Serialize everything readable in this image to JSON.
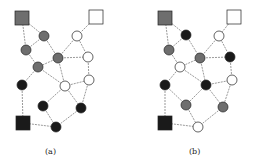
{
  "figure": {
    "panels": [
      {
        "label": "(a)",
        "colors": {
          "gray": "#6e6e6e",
          "black": "#1a1a1a",
          "white": "#ffffff",
          "edge": "#555555"
        },
        "nodes": [
          {
            "id": "sq_gray",
            "shape": "square",
            "fill": "gray",
            "x": 22,
            "y": 18
          },
          {
            "id": "sq_white",
            "shape": "square",
            "fill": "white",
            "x": 96,
            "y": 17
          },
          {
            "id": "sq_black",
            "shape": "square",
            "fill": "black",
            "x": 23,
            "y": 123
          },
          {
            "id": "g1",
            "shape": "circle",
            "fill": "gray",
            "x": 44,
            "y": 36
          },
          {
            "id": "g2",
            "shape": "circle",
            "fill": "gray",
            "x": 26,
            "y": 50
          },
          {
            "id": "g3",
            "shape": "circle",
            "fill": "gray",
            "x": 58,
            "y": 58
          },
          {
            "id": "g4",
            "shape": "circle",
            "fill": "gray",
            "x": 38,
            "y": 67
          },
          {
            "id": "w1",
            "shape": "circle",
            "fill": "white",
            "x": 77,
            "y": 36
          },
          {
            "id": "w2",
            "shape": "circle",
            "fill": "white",
            "x": 88,
            "y": 57
          },
          {
            "id": "w3",
            "shape": "circle",
            "fill": "white",
            "x": 65,
            "y": 86
          },
          {
            "id": "w4",
            "shape": "circle",
            "fill": "white",
            "x": 89,
            "y": 80
          },
          {
            "id": "b1",
            "shape": "circle",
            "fill": "black",
            "x": 22,
            "y": 85
          },
          {
            "id": "b2",
            "shape": "circle",
            "fill": "black",
            "x": 43,
            "y": 106
          },
          {
            "id": "b3",
            "shape": "circle",
            "fill": "black",
            "x": 81,
            "y": 108
          },
          {
            "id": "b4",
            "shape": "circle",
            "fill": "black",
            "x": 56,
            "y": 127
          }
        ],
        "edges": [
          [
            "sq_gray",
            "g1"
          ],
          [
            "sq_gray",
            "g2"
          ],
          [
            "g1",
            "g2"
          ],
          [
            "g1",
            "g3"
          ],
          [
            "g2",
            "g4"
          ],
          [
            "g3",
            "g4"
          ],
          [
            "g3",
            "w1"
          ],
          [
            "g3",
            "w2"
          ],
          [
            "g3",
            "w3"
          ],
          [
            "g4",
            "w3"
          ],
          [
            "g4",
            "b1"
          ],
          [
            "sq_white",
            "w1"
          ],
          [
            "w1",
            "w2"
          ],
          [
            "w2",
            "w4"
          ],
          [
            "w3",
            "w4"
          ],
          [
            "w3",
            "b2"
          ],
          [
            "w3",
            "b3"
          ],
          [
            "w4",
            "b3"
          ],
          [
            "sq_black",
            "b1"
          ],
          [
            "sq_black",
            "b4"
          ],
          [
            "b2",
            "b4"
          ],
          [
            "b4",
            "b3"
          ]
        ]
      },
      {
        "label": "(b)",
        "colors": {
          "gray": "#6e6e6e",
          "black": "#1a1a1a",
          "white": "#ffffff",
          "edge": "#555555"
        },
        "nodes": [
          {
            "id": "sq_gray",
            "shape": "square",
            "fill": "gray",
            "x": 165,
            "y": 18
          },
          {
            "id": "sq_white",
            "shape": "square",
            "fill": "white",
            "x": 234,
            "y": 17
          },
          {
            "id": "sq_black",
            "shape": "square",
            "fill": "black",
            "x": 165,
            "y": 123
          },
          {
            "id": "k1",
            "shape": "circle",
            "fill": "black",
            "x": 186,
            "y": 35
          },
          {
            "id": "w1",
            "shape": "circle",
            "fill": "white",
            "x": 219,
            "y": 36
          },
          {
            "id": "g1",
            "shape": "circle",
            "fill": "gray",
            "x": 169,
            "y": 50
          },
          {
            "id": "g2",
            "shape": "circle",
            "fill": "gray",
            "x": 200,
            "y": 58
          },
          {
            "id": "k2",
            "shape": "circle",
            "fill": "black",
            "x": 230,
            "y": 57
          },
          {
            "id": "w2",
            "shape": "circle",
            "fill": "white",
            "x": 180,
            "y": 67
          },
          {
            "id": "k3",
            "shape": "circle",
            "fill": "black",
            "x": 165,
            "y": 85
          },
          {
            "id": "k4",
            "shape": "circle",
            "fill": "black",
            "x": 206,
            "y": 85
          },
          {
            "id": "w3",
            "shape": "circle",
            "fill": "white",
            "x": 232,
            "y": 80
          },
          {
            "id": "g3",
            "shape": "circle",
            "fill": "gray",
            "x": 186,
            "y": 105
          },
          {
            "id": "g4",
            "shape": "circle",
            "fill": "gray",
            "x": 223,
            "y": 107
          },
          {
            "id": "w4",
            "shape": "circle",
            "fill": "white",
            "x": 198,
            "y": 127
          }
        ],
        "edges": [
          [
            "sq_gray",
            "k1"
          ],
          [
            "sq_gray",
            "g1"
          ],
          [
            "k1",
            "g1"
          ],
          [
            "k1",
            "g2"
          ],
          [
            "g1",
            "w2"
          ],
          [
            "w2",
            "g2"
          ],
          [
            "sq_white",
            "w1"
          ],
          [
            "w1",
            "g2"
          ],
          [
            "w1",
            "k2"
          ],
          [
            "g2",
            "k2"
          ],
          [
            "g2",
            "k4"
          ],
          [
            "k2",
            "w3"
          ],
          [
            "w2",
            "k3"
          ],
          [
            "w2",
            "k4"
          ],
          [
            "k4",
            "w3"
          ],
          [
            "k4",
            "g3"
          ],
          [
            "k4",
            "g4"
          ],
          [
            "w3",
            "g4"
          ],
          [
            "k3",
            "sq_black"
          ],
          [
            "k3",
            "g3"
          ],
          [
            "g3",
            "w4"
          ],
          [
            "sq_black",
            "w4"
          ],
          [
            "w4",
            "g4"
          ]
        ]
      }
    ]
  }
}
